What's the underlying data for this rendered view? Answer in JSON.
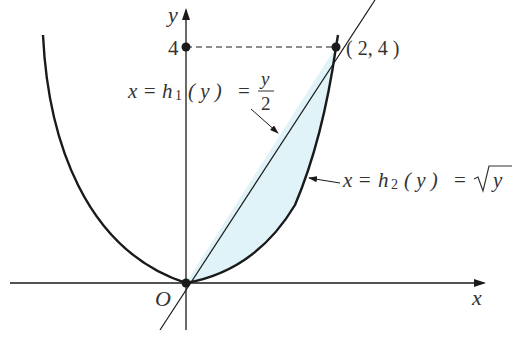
{
  "diagram": {
    "type": "region-between-curves",
    "colors": {
      "background": "#ffffff",
      "ink": "#1a1a1a",
      "shade": "#dff3f8",
      "text": "#333333"
    },
    "axes": {
      "x_label": "x",
      "y_label": "y",
      "origin_label": "O",
      "y_tick_label": "4"
    },
    "point": {
      "label": "( 2, 4 )",
      "x": 2,
      "y": 4
    },
    "curves": [
      {
        "id": "h1",
        "label_prefix": "x =",
        "label_func": "h",
        "label_sub": "1",
        "label_arg": "( y )",
        "label_eq": "=",
        "label_num": "y",
        "label_den": "2",
        "equation": "x = h1(y) = y/2"
      },
      {
        "id": "h2",
        "label_prefix": "x =",
        "label_func": "h",
        "label_sub": "2",
        "label_arg": "( y )",
        "label_eq": "=",
        "label_radicand": "y",
        "equation": "x = h2(y) = sqrt(y)"
      }
    ],
    "shaded_region": "between x = y/2 and x = sqrt(y), 0 ≤ y ≤ 4"
  }
}
